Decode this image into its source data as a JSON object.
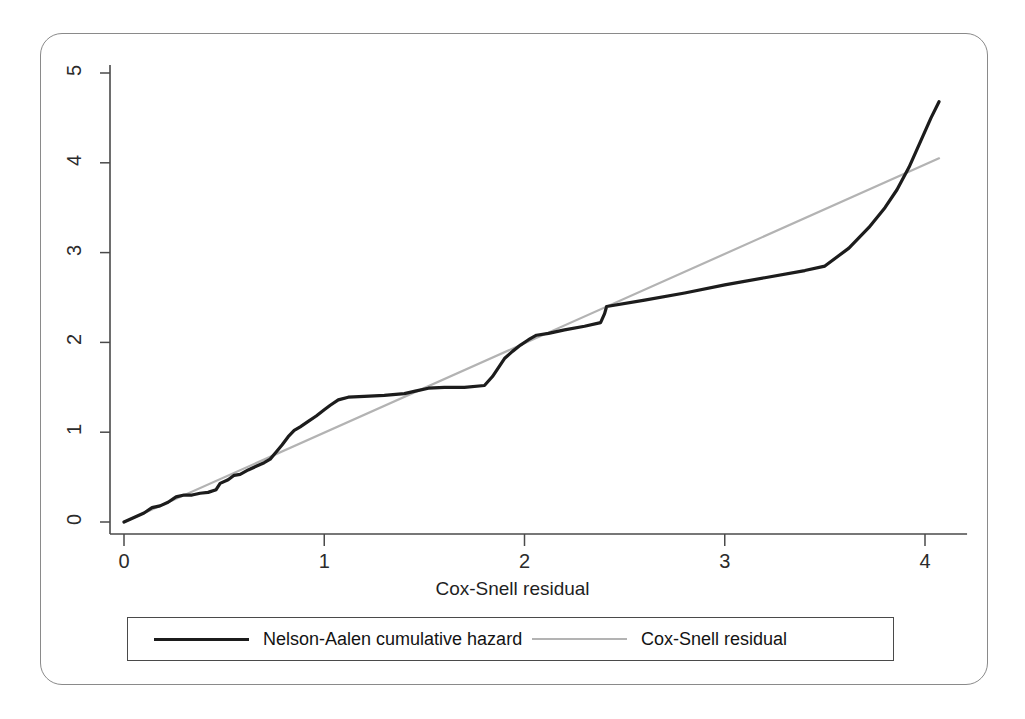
{
  "figure": {
    "frame_border_color": "#8a8a8a",
    "background": "#ffffff"
  },
  "axes": {
    "x_title": "Cox-Snell residual",
    "x_ticks": [
      "0",
      "1",
      "2",
      "3",
      "4"
    ],
    "y_ticks": [
      "0",
      "1",
      "2",
      "3",
      "4",
      "5"
    ],
    "axis_line_color": "#4a4a4a"
  },
  "legend": {
    "entries": [
      {
        "label": "Nelson-Aalen cumulative hazard",
        "color": "#1c1c1c",
        "width": 3.2
      },
      {
        "label": "Cox-Snell residual",
        "color": "#b3b3b3",
        "width": 2.2
      }
    ],
    "border_color": "#4a4a4a"
  },
  "caption": {
    "text": ""
  },
  "chart_data": {
    "type": "line",
    "title": "",
    "subtitle": "",
    "xlabel": "Cox-Snell residual",
    "ylabel": "",
    "xlim": [
      0,
      4.25
    ],
    "ylim": [
      0,
      5.2
    ],
    "xticks": [
      0,
      1,
      2,
      3,
      4
    ],
    "yticks": [
      0,
      1,
      2,
      3,
      4,
      5
    ],
    "grid": false,
    "legend_position": "below-axes",
    "series": [
      {
        "name": "Nelson-Aalen cumulative hazard",
        "color": "#1c1c1c",
        "linewidth": 3.2,
        "points": [
          [
            0.0,
            0.0
          ],
          [
            0.05,
            0.05
          ],
          [
            0.1,
            0.1
          ],
          [
            0.14,
            0.16
          ],
          [
            0.18,
            0.18
          ],
          [
            0.22,
            0.22
          ],
          [
            0.26,
            0.28
          ],
          [
            0.3,
            0.3
          ],
          [
            0.34,
            0.3
          ],
          [
            0.38,
            0.32
          ],
          [
            0.42,
            0.33
          ],
          [
            0.46,
            0.36
          ],
          [
            0.48,
            0.43
          ],
          [
            0.52,
            0.47
          ],
          [
            0.55,
            0.52
          ],
          [
            0.58,
            0.53
          ],
          [
            0.62,
            0.58
          ],
          [
            0.66,
            0.62
          ],
          [
            0.7,
            0.66
          ],
          [
            0.73,
            0.7
          ],
          [
            0.76,
            0.78
          ],
          [
            0.79,
            0.86
          ],
          [
            0.82,
            0.95
          ],
          [
            0.85,
            1.02
          ],
          [
            0.88,
            1.06
          ],
          [
            0.92,
            1.12
          ],
          [
            0.96,
            1.18
          ],
          [
            1.0,
            1.25
          ],
          [
            1.03,
            1.3
          ],
          [
            1.07,
            1.36
          ],
          [
            1.12,
            1.39
          ],
          [
            1.2,
            1.4
          ],
          [
            1.3,
            1.41
          ],
          [
            1.4,
            1.43
          ],
          [
            1.46,
            1.46
          ],
          [
            1.52,
            1.49
          ],
          [
            1.6,
            1.5
          ],
          [
            1.7,
            1.5
          ],
          [
            1.8,
            1.52
          ],
          [
            1.84,
            1.62
          ],
          [
            1.87,
            1.72
          ],
          [
            1.9,
            1.82
          ],
          [
            1.94,
            1.9
          ],
          [
            1.98,
            1.97
          ],
          [
            2.02,
            2.03
          ],
          [
            2.06,
            2.08
          ],
          [
            2.12,
            2.1
          ],
          [
            2.2,
            2.14
          ],
          [
            2.3,
            2.18
          ],
          [
            2.38,
            2.22
          ],
          [
            2.4,
            2.32
          ],
          [
            2.41,
            2.4
          ],
          [
            2.6,
            2.47
          ],
          [
            2.8,
            2.55
          ],
          [
            3.0,
            2.64
          ],
          [
            3.2,
            2.72
          ],
          [
            3.4,
            2.8
          ],
          [
            3.5,
            2.85
          ],
          [
            3.62,
            3.05
          ],
          [
            3.72,
            3.28
          ],
          [
            3.8,
            3.5
          ],
          [
            3.86,
            3.7
          ],
          [
            3.92,
            3.95
          ],
          [
            3.98,
            4.25
          ],
          [
            4.03,
            4.5
          ],
          [
            4.07,
            4.68
          ]
        ]
      },
      {
        "name": "Cox-Snell residual",
        "color": "#b3b3b3",
        "linewidth": 2.2,
        "points": [
          [
            0.0,
            0.0
          ],
          [
            4.07,
            4.05
          ]
        ]
      }
    ]
  }
}
